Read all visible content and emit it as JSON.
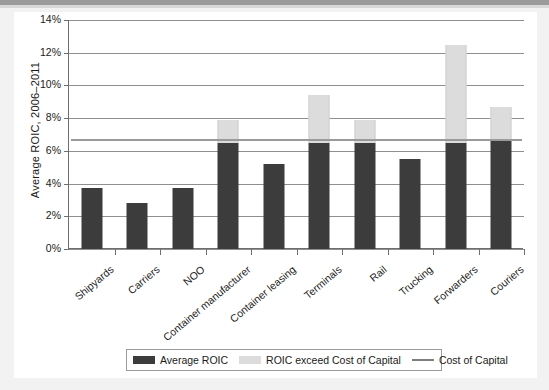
{
  "chart_data": {
    "type": "bar",
    "title": "",
    "xlabel": "",
    "ylabel": "Average ROIC, 2006–2011",
    "ylim": [
      0,
      14
    ],
    "ytick_labels": [
      "0%",
      "2%",
      "4%",
      "6%",
      "8%",
      "10%",
      "12%",
      "14%"
    ],
    "ytick_values": [
      0,
      2,
      4,
      6,
      8,
      10,
      12,
      14
    ],
    "grid": true,
    "legend_position": "bottom",
    "stacked": true,
    "categories": [
      "Shipyards",
      "Carriers",
      "NOO",
      "Container manufacturer",
      "Container leasing",
      "Terminals",
      "Rail",
      "Trucking",
      "Forwarders",
      "Couriers"
    ],
    "series": [
      {
        "name": "Average ROIC",
        "color": "#3c3c3c",
        "values": [
          3.7,
          2.8,
          3.7,
          6.5,
          5.2,
          6.5,
          6.5,
          5.5,
          6.5,
          6.6
        ]
      },
      {
        "name": "ROIC exceed Cost of Capital",
        "color": "#dcdcdc",
        "values": [
          0,
          0,
          0,
          1.4,
          0,
          2.9,
          1.4,
          0,
          6.0,
          2.1
        ]
      }
    ],
    "totals": [
      3.7,
      2.8,
      3.7,
      7.9,
      5.2,
      9.4,
      7.9,
      5.5,
      12.5,
      8.7
    ],
    "reference_line": {
      "name": "Cost of Capital",
      "value": 6.7,
      "color": "#9a9a9a"
    }
  },
  "legend": {
    "items": [
      {
        "label": "Average ROIC",
        "marker": "dark"
      },
      {
        "label": "ROIC exceed Cost of Capital",
        "marker": "light"
      },
      {
        "label": "Cost of Capital",
        "marker": "line"
      }
    ]
  }
}
